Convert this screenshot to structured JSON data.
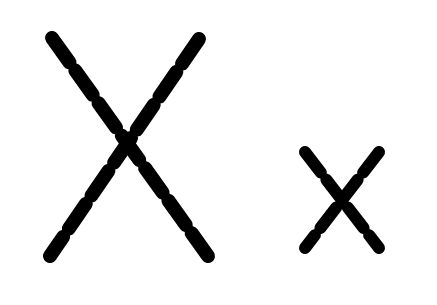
{
  "canvas": {
    "width": 437,
    "height": 305,
    "background_color": "#ffffff",
    "stroke_color": "#000000",
    "description": "Two letter-X glyphs rendered as dashed strokes with rounded caps on a plain white background"
  },
  "glyphs": [
    {
      "name": "large-x",
      "label": "X",
      "center_x": 127,
      "center_y": 141,
      "bbox": [
        45,
        30,
        215,
        265
      ],
      "stroke_width": 14,
      "dash_length": 30,
      "dash_gap": 10,
      "strokes": [
        {
          "name": "large-x-stroke-nwse",
          "x1": 52,
          "y1": 38,
          "x2": 208,
          "y2": 256
        },
        {
          "name": "large-x-stroke-nesw",
          "x1": 199,
          "y1": 39,
          "x2": 50,
          "y2": 256
        }
      ]
    },
    {
      "name": "small-x",
      "label": "X",
      "center_x": 342,
      "center_y": 192,
      "bbox": [
        298,
        144,
        387,
        256
      ],
      "stroke_width": 12,
      "dash_length": 26,
      "dash_gap": 9,
      "strokes": [
        {
          "name": "small-x-stroke-nwse",
          "x1": 305,
          "y1": 152,
          "x2": 379,
          "y2": 248
        },
        {
          "name": "small-x-stroke-nesw",
          "x1": 379,
          "y1": 152,
          "x2": 305,
          "y2": 248
        }
      ]
    }
  ]
}
